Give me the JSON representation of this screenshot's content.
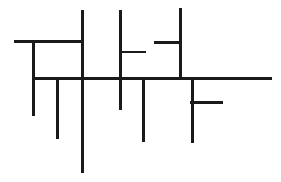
{
  "figure": {
    "canvas": {
      "width": 281,
      "height": 182,
      "background_color": "#ffffff"
    },
    "style": {
      "stroke_color": "#1a1a1a",
      "stroke_width": 3,
      "stroke_width_thin": 2.5,
      "line_cap": "butt"
    },
    "segments": [
      {
        "id": "h-top-left",
        "name": "top-left-horizontal",
        "orientation": "horizontal",
        "x1": 14,
        "y1": 41,
        "x2": 83,
        "y2": 41,
        "width": 3
      },
      {
        "id": "h-mid-stub",
        "name": "middle-right-stub",
        "orientation": "horizontal",
        "x1": 119,
        "y1": 52,
        "x2": 146,
        "y2": 52,
        "width": 2.5
      },
      {
        "id": "h-upper-right-stub",
        "name": "upper-right-left-stub",
        "orientation": "horizontal",
        "x1": 154,
        "y1": 42,
        "x2": 181,
        "y2": 42,
        "width": 3
      },
      {
        "id": "h-main",
        "name": "main-horizontal-spine",
        "orientation": "horizontal",
        "x1": 32,
        "y1": 78,
        "x2": 272,
        "y2": 78,
        "width": 3
      },
      {
        "id": "h-f-stub",
        "name": "lower-right-f-stub",
        "orientation": "horizontal",
        "x1": 190,
        "y1": 102,
        "x2": 223,
        "y2": 102,
        "width": 3
      },
      {
        "id": "v-left-short",
        "name": "left-short-vertical",
        "orientation": "vertical",
        "x1": 33,
        "y1": 40,
        "x2": 33,
        "y2": 116,
        "width": 3
      },
      {
        "id": "v-left-mid",
        "name": "left-middle-vertical",
        "orientation": "vertical",
        "x1": 57,
        "y1": 77,
        "x2": 57,
        "y2": 139,
        "width": 3
      },
      {
        "id": "v-tall-center",
        "name": "tall-center-vertical",
        "orientation": "vertical",
        "x1": 82,
        "y1": 10,
        "x2": 82,
        "y2": 173,
        "width": 3
      },
      {
        "id": "v-upper-center",
        "name": "upper-center-vertical",
        "orientation": "vertical",
        "x1": 120,
        "y1": 10,
        "x2": 120,
        "y2": 110,
        "width": 3
      },
      {
        "id": "v-lower-center",
        "name": "lower-center-vertical",
        "orientation": "vertical",
        "x1": 143,
        "y1": 77,
        "x2": 143,
        "y2": 142,
        "width": 3
      },
      {
        "id": "v-upper-right",
        "name": "upper-right-vertical",
        "orientation": "vertical",
        "x1": 180,
        "y1": 8,
        "x2": 180,
        "y2": 79,
        "width": 3
      },
      {
        "id": "v-lower-right",
        "name": "lower-right-vertical",
        "orientation": "vertical",
        "x1": 192,
        "y1": 77,
        "x2": 192,
        "y2": 143,
        "width": 3
      }
    ],
    "counts": {
      "total_segments": 12,
      "horizontal_segments": 5,
      "vertical_segments": 7
    }
  }
}
